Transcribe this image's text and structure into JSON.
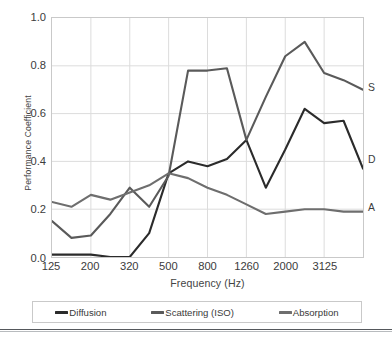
{
  "chart_data": {
    "type": "line",
    "title": "",
    "xlabel": "Frequency (Hz)",
    "ylabel": "Performance Coefficient",
    "ylim": [
      0.0,
      1.0
    ],
    "y_ticks": [
      "1.0",
      "0.8",
      "0.6",
      "0.4",
      "0.2",
      "0.0"
    ],
    "y_tick_values": [
      1.0,
      0.8,
      0.6,
      0.4,
      0.2,
      0.0
    ],
    "x_ticks": [
      "125",
      "200",
      "320",
      "500",
      "800",
      "1260",
      "2000",
      "3125"
    ],
    "x_tick_values": [
      125,
      200,
      320,
      500,
      800,
      1260,
      2000,
      3125
    ],
    "x_scale": "log-third-octave",
    "grid": true,
    "legend_position": "bottom",
    "categories": [
      125,
      160,
      200,
      250,
      320,
      400,
      500,
      630,
      800,
      1000,
      1260,
      1600,
      2000,
      2500,
      3125,
      4000,
      5000
    ],
    "series": [
      {
        "name": "Diffusion",
        "color": "#2b2b2b",
        "end_label": "D",
        "values": [
          0.01,
          0.01,
          0.01,
          0.0,
          0.0,
          0.1,
          0.35,
          0.4,
          0.38,
          0.41,
          0.49,
          0.29,
          0.45,
          0.62,
          0.56,
          0.57,
          0.37
        ]
      },
      {
        "name": "Scattering (ISO)",
        "color": "#5a5a5a",
        "end_label": "S",
        "values": [
          0.15,
          0.08,
          0.09,
          0.18,
          0.29,
          0.21,
          0.34,
          0.78,
          0.78,
          0.79,
          0.49,
          0.67,
          0.84,
          0.9,
          0.77,
          0.74,
          0.7
        ]
      },
      {
        "name": "Absorption",
        "color": "#6e6e6e",
        "end_label": "A",
        "values": [
          0.23,
          0.21,
          0.26,
          0.24,
          0.27,
          0.3,
          0.35,
          0.33,
          0.29,
          0.26,
          0.22,
          0.18,
          0.19,
          0.2,
          0.2,
          0.19,
          0.19
        ]
      }
    ]
  },
  "axes": {
    "y_title": "Performance Coefficient",
    "x_title": "Frequency (Hz)",
    "y_tick_labels": [
      "1.0",
      "0.8",
      "0.6",
      "0.4",
      "0.2",
      "0.0"
    ],
    "x_tick_labels": [
      "125",
      "200",
      "320",
      "500",
      "800",
      "1260",
      "2000",
      "3125"
    ]
  },
  "end_labels": [
    {
      "text": "S",
      "series": "Scattering (ISO)"
    },
    {
      "text": "D",
      "series": "Diffusion"
    },
    {
      "text": "A",
      "series": "Absorption"
    }
  ],
  "legend": {
    "items": [
      {
        "label": "Diffusion",
        "color": "#2b2b2b"
      },
      {
        "label": "Scattering (ISO)",
        "color": "#5a5a5a"
      },
      {
        "label": "Absorption",
        "color": "#6e6e6e"
      }
    ]
  },
  "colors": {
    "background": "#ffffff",
    "grid": "#dcdcdc",
    "frame": "#c9c9c9",
    "text": "#3c3c3c"
  }
}
